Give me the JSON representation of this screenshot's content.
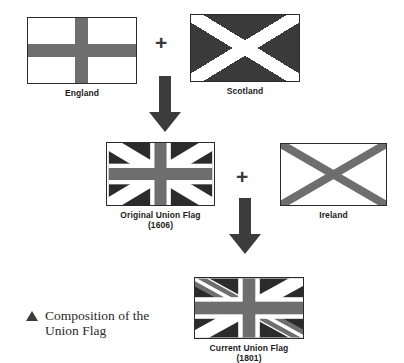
{
  "figure": {
    "caption_marker": "triangle-marker",
    "caption_line1": "Composition of the",
    "caption_line2": "Union Flag"
  },
  "colors": {
    "field_dark": "#2b2b2b",
    "field_navy": "#3a3a3a",
    "cross_gray": "#6e6e6e",
    "white": "#ffffff",
    "border": "#2b2b2b",
    "text": "#1b1b1b",
    "arrow": "#3c3c3c"
  },
  "flags": [
    {
      "id": "england",
      "label": "England",
      "year": "",
      "description": "white field with gray St George cross"
    },
    {
      "id": "scotland",
      "label": "Scotland",
      "year": "",
      "description": "dark field with white St Andrew saltire"
    },
    {
      "id": "original-union-flag",
      "label": "Original Union Flag",
      "year": "(1606)",
      "description": "dark field, white saltire, gray cross with white fimbriation"
    },
    {
      "id": "ireland",
      "label": "Ireland",
      "year": "",
      "description": "white field with gray St Patrick saltire"
    },
    {
      "id": "current-union-flag",
      "label": "Current Union Flag",
      "year": "(1801)",
      "description": "dark field, counterchanged white and gray saltires, gray cross with white fimbriation"
    }
  ],
  "operators": [
    {
      "id": "plus-england-scotland",
      "symbol": "+"
    },
    {
      "id": "plus-original-ireland",
      "symbol": "+"
    }
  ],
  "arrows": [
    {
      "id": "arrow-to-original",
      "direction": "down"
    },
    {
      "id": "arrow-to-current",
      "direction": "down"
    }
  ]
}
